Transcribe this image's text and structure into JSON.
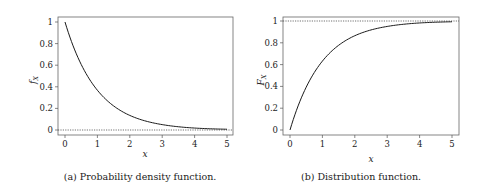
{
  "chart_data": [
    {
      "type": "line",
      "title": "",
      "caption": "(a) Probability density function.",
      "xlabel": "x",
      "ylabel": "f_X",
      "xlim": [
        0,
        5
      ],
      "ylim": [
        0,
        1
      ],
      "xticks": [
        "0",
        "1",
        "2",
        "3",
        "4",
        "5"
      ],
      "yticks": [
        "0",
        "0.2",
        "0.4",
        "0.6",
        "0.8",
        "1"
      ],
      "reference_line": {
        "y": 0,
        "style": "dotted"
      },
      "series": [
        {
          "name": "f_X(x) = e^{-x}",
          "x": [
            0,
            0.5,
            1,
            1.5,
            2,
            2.5,
            3,
            3.5,
            4,
            4.5,
            5
          ],
          "y": [
            1.0,
            0.607,
            0.368,
            0.223,
            0.135,
            0.082,
            0.05,
            0.03,
            0.018,
            0.011,
            0.007
          ]
        }
      ]
    },
    {
      "type": "line",
      "title": "",
      "caption": "(b) Distribution function.",
      "xlabel": "x",
      "ylabel": "F_X",
      "xlim": [
        0,
        5
      ],
      "ylim": [
        0,
        1
      ],
      "xticks": [
        "0",
        "1",
        "2",
        "3",
        "4",
        "5"
      ],
      "yticks": [
        "0",
        "0.2",
        "0.4",
        "0.6",
        "0.8",
        "1"
      ],
      "reference_line": {
        "y": 1,
        "style": "dotted"
      },
      "series": [
        {
          "name": "F_X(x) = 1 - e^{-x}",
          "x": [
            0,
            0.5,
            1,
            1.5,
            2,
            2.5,
            3,
            3.5,
            4,
            4.5,
            5
          ],
          "y": [
            0.0,
            0.393,
            0.632,
            0.777,
            0.865,
            0.918,
            0.95,
            0.97,
            0.982,
            0.989,
            0.993
          ]
        }
      ]
    }
  ],
  "captions": {
    "a": "(a) Probability density function.",
    "b": "(b) Distribution function."
  },
  "axis_labels": {
    "a_x": "x",
    "a_y_main": "f",
    "a_y_sub": "X",
    "b_x": "x",
    "b_y_main": "F",
    "b_y_sub": "X"
  },
  "ticks": {
    "x": [
      "0",
      "1",
      "2",
      "3",
      "4",
      "5"
    ],
    "y": [
      "0",
      "0.2",
      "0.4",
      "0.6",
      "0.8",
      "1"
    ]
  },
  "colors": {
    "line": "#1a1a1a",
    "frame": "#555555",
    "ref": "#333333"
  }
}
